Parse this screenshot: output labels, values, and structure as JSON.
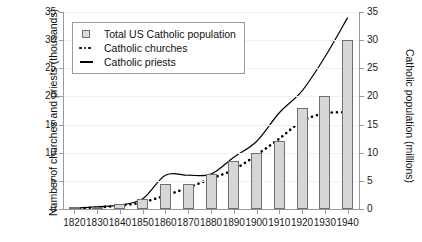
{
  "chart_data": {
    "type": "line",
    "title": "",
    "xlabel": "",
    "ylabel": "Number of churches and priests (thousands)",
    "ylabel_right": "Catholic population (millions)",
    "grid": true,
    "legend_position": "top-left",
    "x": [
      1820,
      1830,
      1840,
      1850,
      1860,
      1870,
      1880,
      1890,
      1900,
      1910,
      1920,
      1930,
      1940
    ],
    "xlim": [
      1815,
      1945
    ],
    "xticks": [
      "1820",
      "1830",
      "1840",
      "1850",
      "1860",
      "1870",
      "1880",
      "1890",
      "1900",
      "1910",
      "1920",
      "1930",
      "1940"
    ],
    "ylim": [
      0,
      35
    ],
    "yticks": [
      "0",
      "5",
      "10",
      "15",
      "20",
      "25",
      "30",
      "35"
    ],
    "ylim_right": [
      0,
      35
    ],
    "yticks_right": [
      "0",
      "5",
      "10",
      "15",
      "20",
      "25",
      "30",
      "35"
    ],
    "series": [
      {
        "name": "Total US Catholic population",
        "type": "bar",
        "axis": "right",
        "units": "millions",
        "values": [
          0.2,
          0.3,
          0.9,
          1.8,
          4.4,
          4.4,
          6.3,
          8.6,
          10.0,
          12.0,
          18.0,
          20.0,
          30.0
        ]
      },
      {
        "name": "Catholic churches",
        "type": "dotted-line",
        "axis": "left",
        "units": "thousands",
        "values": [
          0.1,
          0.3,
          0.6,
          1.2,
          2.4,
          3.8,
          5.4,
          7.0,
          9.6,
          12.5,
          15.6,
          17.0,
          17.2
        ]
      },
      {
        "name": "Catholic priests",
        "type": "solid-line",
        "axis": "left",
        "units": "thousands",
        "values": [
          0.15,
          0.4,
          0.7,
          1.8,
          6.0,
          6.0,
          6.2,
          9.2,
          12.0,
          17.1,
          21.0,
          27.0,
          34.0
        ]
      }
    ]
  },
  "legend": {
    "items": [
      {
        "label": "Total US Catholic population",
        "marker": "square-swatch"
      },
      {
        "label": "Catholic churches",
        "marker": "dotted-swatch"
      },
      {
        "label": "Catholic priests",
        "marker": "line-swatch"
      }
    ]
  },
  "colors": {
    "bar_fill": "#d6d6d6",
    "bar_stroke": "#6f6f6f",
    "line": "#000000",
    "axis": "#9a9a9a",
    "grid": "#efefef",
    "text": "#111111",
    "background": "#ffffff"
  }
}
